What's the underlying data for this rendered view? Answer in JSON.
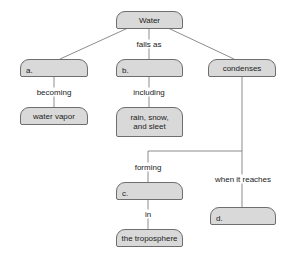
{
  "diagram": {
    "type": "concept-map",
    "colors": {
      "node_fill": "#d9d9d9",
      "node_border": "#6e6e6e",
      "line": "#6e6e6e"
    },
    "nodes": {
      "water": "Water",
      "a": "a.",
      "b": "b.",
      "condenses": "condenses",
      "water_vapor": "water vapor",
      "rain": "rain, snow, and sleet",
      "c": "c.",
      "d": "d.",
      "troposphere": "the troposphere"
    },
    "links": {
      "falls_as": "falls as",
      "becoming": "becoming",
      "including": "including",
      "forming": "forming",
      "when_it_reaches": "when it reaches",
      "in": "in"
    }
  }
}
